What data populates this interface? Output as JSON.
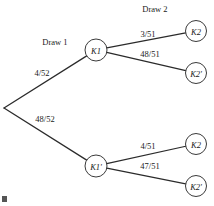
{
  "figure": {
    "type": "probability-tree-diagram",
    "stage_headers": [
      {
        "name": "draw-1-header",
        "label": "Draw 1",
        "x": 55,
        "y": 45
      },
      {
        "name": "draw-2-header",
        "label": "Draw 2",
        "x": 155,
        "y": 12
      }
    ],
    "root": {
      "name": "root-node",
      "x": 4,
      "y": 108
    },
    "nodes": [
      {
        "id": "k1",
        "label": "K1",
        "x": 96,
        "y": 50,
        "r": 11
      },
      {
        "id": "k1prime",
        "label": "K1'",
        "x": 96,
        "y": 166,
        "r": 11
      },
      {
        "id": "k2_top",
        "label": "K2",
        "x": 196,
        "y": 31,
        "r": 10.5
      },
      {
        "id": "k2p_top",
        "label": "K2'",
        "x": 196,
        "y": 73,
        "r": 10.5
      },
      {
        "id": "k2_bot",
        "label": "K2",
        "x": 196,
        "y": 144,
        "r": 10.5
      },
      {
        "id": "k2p_bot",
        "label": "K2'",
        "x": 196,
        "y": 186,
        "r": 10.5
      }
    ],
    "edges": [
      {
        "id": "root-k1",
        "from": "root",
        "to": "k1",
        "label": "4/52",
        "lx": 42,
        "ly": 76
      },
      {
        "id": "root-k1prime",
        "from": "root",
        "to": "k1prime",
        "label": "48/52",
        "lx": 45,
        "ly": 122
      },
      {
        "id": "k1-k2",
        "from": "k1",
        "to": "k2_top",
        "label": "3/51",
        "lx": 148,
        "ly": 37
      },
      {
        "id": "k1-k2prime",
        "from": "k1",
        "to": "k2p_top",
        "label": "48/51",
        "lx": 150,
        "ly": 57
      },
      {
        "id": "k1prime-k2",
        "from": "k1prime",
        "to": "k2_bot",
        "label": "4/51",
        "lx": 148,
        "ly": 149
      },
      {
        "id": "k1prime-k2prime",
        "from": "k1prime",
        "to": "k2p_bot",
        "label": "47/51",
        "lx": 150,
        "ly": 169
      }
    ],
    "colors": {
      "ink": "#1a1a1a",
      "line": "#2b2b2b",
      "node_stroke": "#3a3a3a",
      "background": "#ffffff"
    }
  },
  "chart_data": {
    "type": "diagram",
    "title": "",
    "stages": [
      "Draw 1",
      "Draw 2"
    ],
    "branches": [
      {
        "path": [
          "K1"
        ],
        "probability": "4/52"
      },
      {
        "path": [
          "K1'"
        ],
        "probability": "48/52"
      },
      {
        "path": [
          "K1",
          "K2"
        ],
        "probability": "3/51"
      },
      {
        "path": [
          "K1",
          "K2'"
        ],
        "probability": "48/51"
      },
      {
        "path": [
          "K1'",
          "K2"
        ],
        "probability": "4/51"
      },
      {
        "path": [
          "K1'",
          "K2'"
        ],
        "probability": "47/51"
      }
    ]
  }
}
